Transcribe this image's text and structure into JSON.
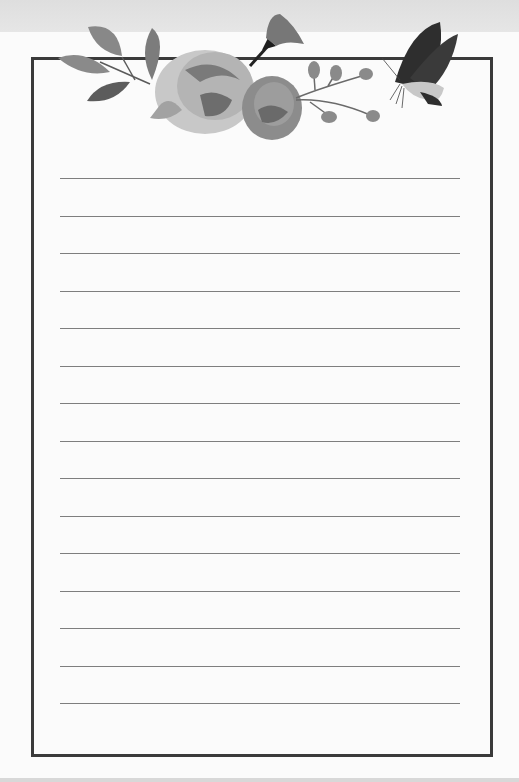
{
  "page": {
    "type": "lined-stationery",
    "line_count": 15,
    "lines_top_px": [
      178,
      216,
      253,
      291,
      328,
      366,
      403,
      441,
      478,
      516,
      553,
      591,
      628,
      666,
      703
    ],
    "colors": {
      "frame": "#3a3a3a",
      "rule": "#7e7e7e",
      "paper": "#fbfbfb",
      "top_band": "#e0e0e0"
    }
  },
  "decoration": {
    "elements": [
      "leaf-sprig-icon",
      "rose-icon",
      "rose-small-icon",
      "bellflower-icon",
      "berry-sprig-icon",
      "butterfly-icon"
    ]
  }
}
